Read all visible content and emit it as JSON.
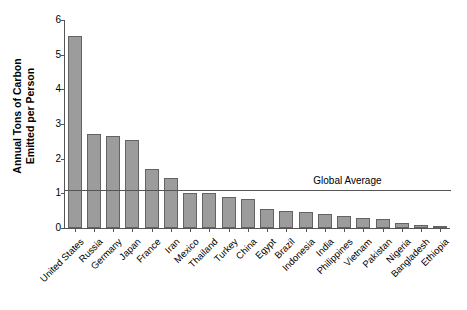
{
  "chart_data": {
    "type": "bar",
    "title": "",
    "xlabel": "",
    "ylabel": "Annual Tons of Carbon Emitted per Person",
    "ylabel_line1": "Annual Tons of Carbon",
    "ylabel_line2": "Emitted per Person",
    "ylim": [
      0,
      6
    ],
    "yticks": [
      0,
      1,
      2,
      3,
      4,
      5,
      6
    ],
    "ytick_labels": [
      "0",
      "1",
      "2",
      "3",
      "4",
      "5",
      "6"
    ],
    "grid": false,
    "legend": "none",
    "categories": [
      "United States",
      "Russia",
      "Germany",
      "Japan",
      "France",
      "Iran",
      "Mexico",
      "Thailand",
      "Turkey",
      "China",
      "Egypt",
      "Brazil",
      "Indonesia",
      "India",
      "Philippines",
      "Vietnam",
      "Pakistan",
      "Nigeria",
      "Bangladesh",
      "Ethiopia"
    ],
    "values": [
      5.55,
      2.7,
      2.65,
      2.55,
      1.7,
      1.45,
      1.0,
      1.0,
      0.9,
      0.85,
      0.55,
      0.5,
      0.45,
      0.4,
      0.35,
      0.3,
      0.25,
      0.15,
      0.08,
      0.05
    ],
    "bar_color": "#9c9c9c",
    "bar_edge_color": "#636363",
    "axis_color": "#555555",
    "annotations": [
      {
        "name": "global-average",
        "label": "Global Average",
        "value": 1.1,
        "type": "hline"
      }
    ]
  }
}
